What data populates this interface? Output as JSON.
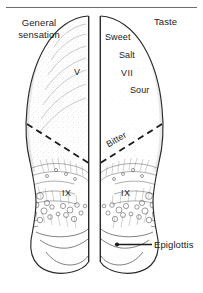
{
  "figure": {
    "type": "anatomical-line-drawing",
    "top_rule": true,
    "background_color": "#ffffff",
    "ink_color": "#1b1b1b"
  },
  "labels": {
    "left_heading": "General\nsensation",
    "left_heading_line1": "General",
    "left_heading_line2": "sensation",
    "right_heading": "Taste",
    "left_nerve_anterior": "V",
    "left_nerve_posterior": "IX",
    "right_nerve_anterior": "VII",
    "right_nerve_posterior": "IX",
    "taste_sweet": "Sweet",
    "taste_salt": "Salt",
    "taste_sour": "Sour",
    "taste_bitter": "Bitter",
    "epiglottis": "Epiglottis"
  },
  "annotations": {
    "left_half": {
      "region_anterior_label": "V",
      "region_posterior_label": "IX",
      "boundary": "dashed"
    },
    "right_half": {
      "taste_qualities": [
        "Sweet",
        "Salt",
        "Sour",
        "Bitter"
      ],
      "region_anterior_label": "VII",
      "region_posterior_label": "IX",
      "boundary": "dashed",
      "callout": "Epiglottis"
    }
  }
}
